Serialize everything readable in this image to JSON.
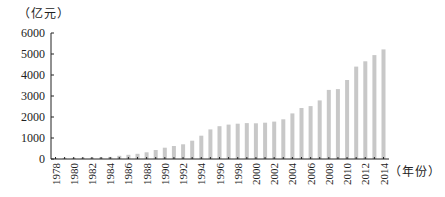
{
  "chart_data": {
    "type": "bar",
    "title": "",
    "ylabel": "（亿元）",
    "xlabel": "（年份）",
    "ylim": [
      0,
      6000
    ],
    "yticks": [
      0,
      1000,
      2000,
      3000,
      4000,
      5000,
      6000
    ],
    "xtick_labels": [
      "1978",
      "1980",
      "1982",
      "1984",
      "1986",
      "1988",
      "1990",
      "1992",
      "1994",
      "1996",
      "1998",
      "2000",
      "2002",
      "2004",
      "2006",
      "2008",
      "2010",
      "2012",
      "2014"
    ],
    "grid": false,
    "legend": null,
    "bar_color": "#c8c8c8",
    "categories": [
      "1978",
      "1979",
      "1980",
      "1981",
      "1982",
      "1983",
      "1984",
      "1985",
      "1986",
      "1987",
      "1988",
      "1989",
      "1990",
      "1991",
      "1992",
      "1993",
      "1994",
      "1995",
      "1996",
      "1997",
      "1998",
      "1999",
      "2000",
      "2001",
      "2002",
      "2003",
      "2004",
      "2005",
      "2006",
      "2007",
      "2008",
      "2009",
      "2010",
      "2011",
      "2012",
      "2013",
      "2014"
    ],
    "values": [
      40,
      50,
      55,
      60,
      65,
      75,
      100,
      150,
      200,
      250,
      320,
      430,
      540,
      620,
      700,
      870,
      1110,
      1410,
      1560,
      1640,
      1680,
      1710,
      1700,
      1730,
      1780,
      1890,
      2170,
      2430,
      2520,
      2790,
      3290,
      3330,
      3760,
      4400,
      4650,
      4950,
      5220
    ]
  },
  "labels": {
    "y_unit": "（亿元）",
    "x_unit": "（年份）"
  }
}
